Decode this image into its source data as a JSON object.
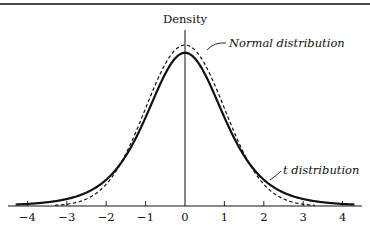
{
  "chart_data": {
    "type": "line",
    "title": "",
    "xlabel": "",
    "ylabel": "Density",
    "xlim": [
      -4.4,
      4.4
    ],
    "ylim": [
      0,
      0.42
    ],
    "grid": false,
    "x_ticks": [
      -4,
      -3,
      -2,
      -1,
      0,
      1,
      2,
      3,
      4
    ],
    "x_tick_labels": [
      "−4",
      "−3",
      "−2",
      "−1",
      "0",
      "1",
      "2",
      "3",
      "4"
    ],
    "series": [
      {
        "name": "Normal distribution",
        "style": "dashed",
        "peak_density": 0.399,
        "x": [
          -4,
          -3,
          -2,
          -1,
          0,
          1,
          2,
          3,
          4
        ],
        "values": [
          0.0001,
          0.0044,
          0.054,
          0.242,
          0.399,
          0.242,
          0.054,
          0.0044,
          0.0001
        ]
      },
      {
        "name": "t distribution",
        "style": "solid",
        "peak_density": 0.38,
        "x": [
          -4,
          -3,
          -2,
          -1,
          0,
          1,
          2,
          3,
          4
        ],
        "values": [
          0.0051,
          0.0173,
          0.0651,
          0.2197,
          0.3796,
          0.2197,
          0.0651,
          0.0173,
          0.0051
        ]
      }
    ],
    "annotations": [
      {
        "text": "Normal distribution",
        "points_to": "normal curve near peak (right side)"
      },
      {
        "text": "t distribution",
        "points_to": "t curve right tail near x≈1.9"
      }
    ]
  },
  "labels": {
    "ylabel": "Density",
    "normal": "Normal distribution",
    "t": "t distribution",
    "ticks": [
      "−4",
      "−3",
      "−2",
      "−1",
      "0",
      "1",
      "2",
      "3",
      "4"
    ]
  }
}
